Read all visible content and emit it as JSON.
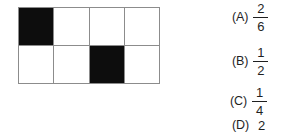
{
  "question_figure": {
    "name": "shaded-rectangle-grid",
    "columns": 4,
    "rows": 2,
    "total_cells": 8,
    "shaded_cells": 2,
    "cells": [
      {
        "row": 1,
        "col": 1,
        "state": "shaded"
      },
      {
        "row": 1,
        "col": 2,
        "state": "unshaded"
      },
      {
        "row": 1,
        "col": 3,
        "state": "unshaded"
      },
      {
        "row": 1,
        "col": 4,
        "state": "unshaded"
      },
      {
        "row": 2,
        "col": 1,
        "state": "unshaded"
      },
      {
        "row": 2,
        "col": 2,
        "state": "unshaded"
      },
      {
        "row": 2,
        "col": 3,
        "state": "shaded"
      },
      {
        "row": 2,
        "col": 4,
        "state": "unshaded"
      }
    ],
    "colors": {
      "shaded": "#0d0d0d",
      "unshaded": "#ffffff",
      "gridline": "#8c8c8c"
    }
  },
  "answers": {
    "options": [
      {
        "id": "a",
        "label": "(A)",
        "type": "fraction",
        "numerator": "2",
        "denominator": "6",
        "text": "2/6"
      },
      {
        "id": "b",
        "label": "(B)",
        "type": "fraction",
        "numerator": "1",
        "denominator": "2",
        "text": "1/2"
      },
      {
        "id": "c",
        "label": "(C)",
        "type": "fraction",
        "numerator": "1",
        "denominator": "4",
        "text": "1/4"
      },
      {
        "id": "d",
        "label": "(D)",
        "type": "plain",
        "value": "2",
        "text": "2"
      }
    ]
  }
}
